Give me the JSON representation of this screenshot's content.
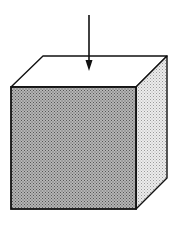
{
  "diagram": {
    "colors": {
      "background": "#ffffff",
      "stroke": "#111111",
      "top_face": "#ffffff",
      "front_face": "#9a9a9a",
      "side_face": "#dcdcdc"
    },
    "elements": [
      {
        "name": "downward-arrow",
        "x": 89,
        "y_start": 15,
        "y_end": 70
      },
      {
        "name": "top-face"
      },
      {
        "name": "front-face",
        "shading": "dark-dotted"
      },
      {
        "name": "side-face",
        "shading": "light-dotted"
      }
    ]
  }
}
